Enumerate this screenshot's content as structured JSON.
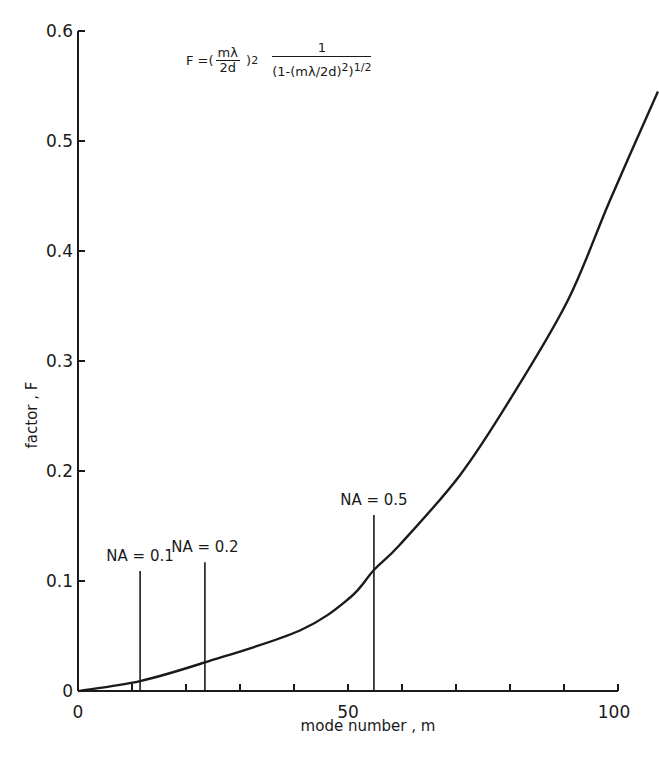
{
  "chart_data": {
    "type": "line",
    "title": "",
    "formula": {
      "lhs": "F =",
      "frac_num": "mλ",
      "frac_den": "2d",
      "exponent": "2",
      "right_num": "1",
      "right_den": "(1-(mλ/2d)",
      "right_den_exp": "2",
      "right_den_close": ")",
      "outer_exp": "1/2"
    },
    "xlabel": "mode number , m",
    "ylabel": "factor , F",
    "xlim": [
      0,
      107
    ],
    "ylim": [
      0,
      0.6
    ],
    "x_ticks": [
      0,
      50,
      100
    ],
    "x_tick_labels": [
      "0",
      "50",
      "100"
    ],
    "x_minor_ticks": [
      10,
      20,
      30,
      40,
      60,
      70,
      80,
      90
    ],
    "y_ticks": [
      0,
      0.1,
      0.2,
      0.3,
      0.4,
      0.5,
      0.6
    ],
    "y_tick_labels": [
      "0",
      "0.1",
      "0.2",
      "0.3",
      "0.4",
      "0.5",
      "0.6"
    ],
    "grid": false,
    "series": [
      {
        "name": "F",
        "x": [
          0,
          11.5,
          23.5,
          41.1,
          50.4,
          54.8,
          59.6,
          70.7,
          80.0,
          90.7,
          98.5,
          107.4
        ],
        "y": [
          0,
          0.009,
          0.026,
          0.055,
          0.085,
          0.11,
          0.133,
          0.196,
          0.265,
          0.355,
          0.446,
          0.545
        ]
      }
    ],
    "annotations": [
      {
        "label": "NA = 0.1",
        "x": 11.5,
        "y_top": 0.109
      },
      {
        "label": "NA = 0.2",
        "x": 23.5,
        "y_top": 0.117
      },
      {
        "label": "NA = 0.5",
        "x": 54.8,
        "y_top": 0.16
      }
    ]
  }
}
